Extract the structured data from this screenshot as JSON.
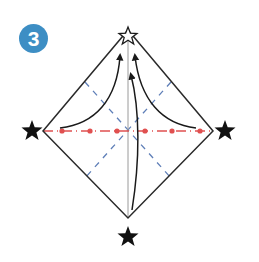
{
  "step": {
    "number": "3",
    "badge_color": "#3d8ec4",
    "text_color": "#ffffff"
  },
  "diagram": {
    "shape": "diamond",
    "vertices": {
      "top": [
        128,
        30
      ],
      "right": [
        213,
        131
      ],
      "bottom": [
        128,
        218
      ],
      "left": [
        43,
        131
      ]
    },
    "outline_color": "#2a2a2a",
    "center_line_color": "#9a9a9a",
    "valley_fold_color": "#5f7fb8",
    "mountain_fold_color": "#e05050",
    "arrow_color": "#1a1a1a",
    "markers": [
      {
        "name": "top",
        "type": "outline-star",
        "x": 128,
        "y": 37
      },
      {
        "name": "left",
        "type": "filled-star",
        "x": 32,
        "y": 131
      },
      {
        "name": "right",
        "type": "filled-star",
        "x": 225,
        "y": 131
      },
      {
        "name": "bottom",
        "type": "filled-star",
        "x": 128,
        "y": 237
      }
    ],
    "arrows": [
      {
        "from": "left",
        "to": "top"
      },
      {
        "from": "right",
        "to": "top"
      },
      {
        "from": "bottom",
        "to": "top"
      }
    ]
  }
}
